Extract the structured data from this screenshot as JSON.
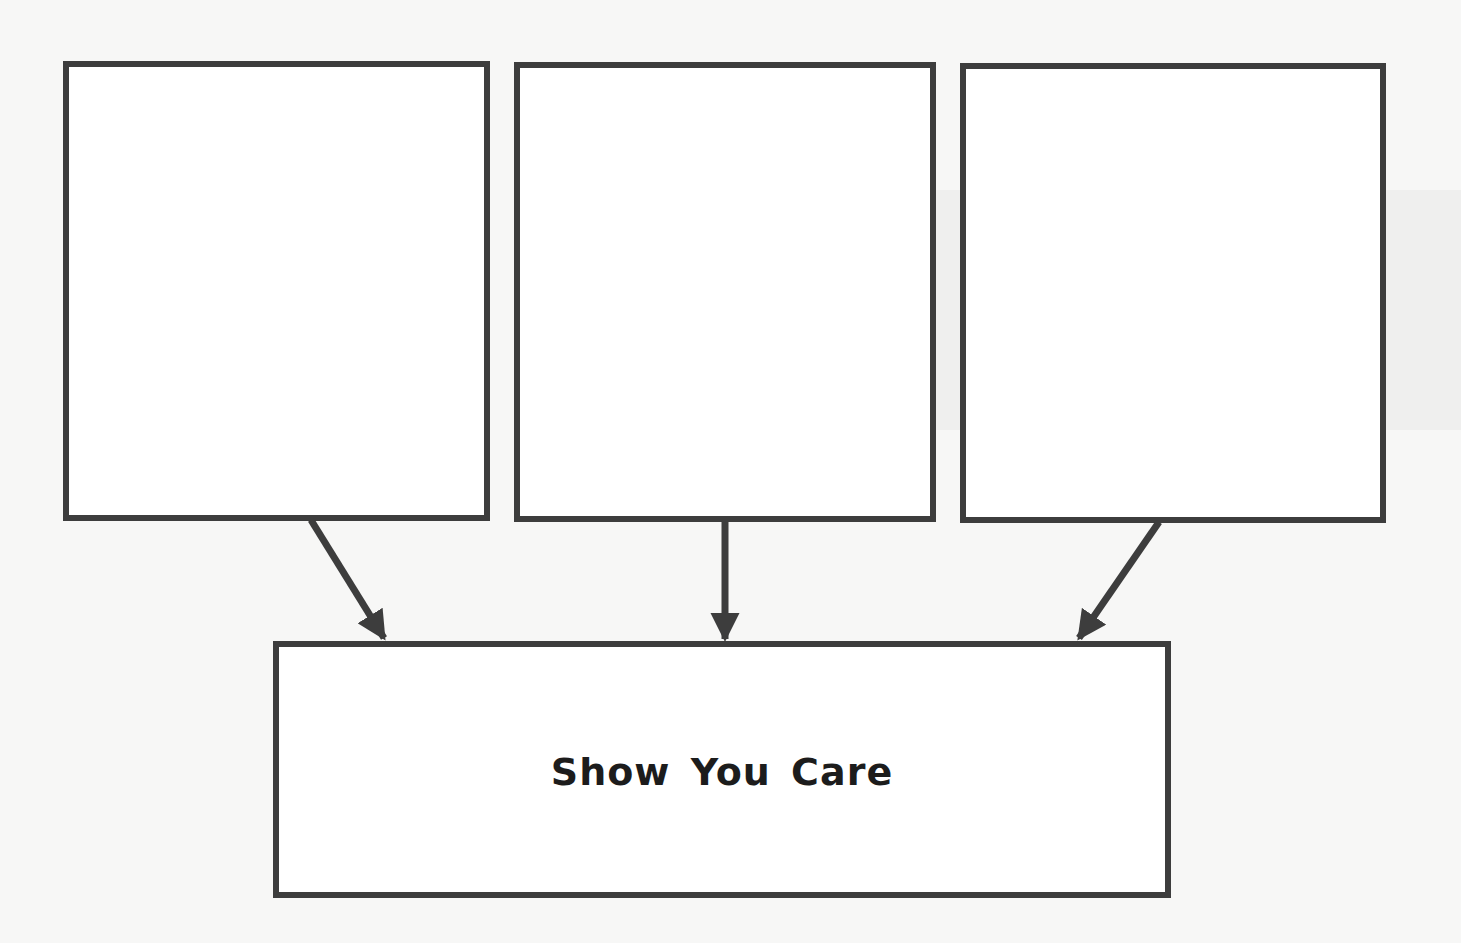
{
  "diagram": {
    "type": "graphic-organizer",
    "input_boxes": [
      {
        "id": "box-1",
        "label": ""
      },
      {
        "id": "box-2",
        "label": ""
      },
      {
        "id": "box-3",
        "label": ""
      }
    ],
    "target_box": {
      "label": "Show You Care"
    },
    "edges": [
      {
        "from": "box-1",
        "to": "target"
      },
      {
        "from": "box-2",
        "to": "target"
      },
      {
        "from": "box-3",
        "to": "target"
      }
    ],
    "colors": {
      "stroke": "#3d3d3d",
      "text": "#1c1c1c",
      "background": "#f7f7f6"
    }
  }
}
